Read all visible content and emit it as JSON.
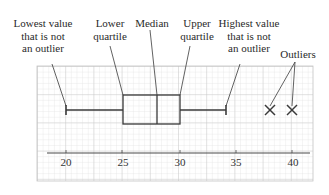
{
  "diagram": {
    "type": "box-plot",
    "labels": {
      "lowest": [
        "Lowest value",
        "that is not",
        "an outlier"
      ],
      "lower_quartile": [
        "Lower",
        "quartile"
      ],
      "median": [
        "Median"
      ],
      "upper_quartile": [
        "Upper",
        "quartile"
      ],
      "highest": [
        "Highest value",
        "that is not",
        "an outlier"
      ],
      "outliers": [
        "Outliers"
      ]
    },
    "axis": {
      "ticks": [
        "20",
        "25",
        "30",
        "35",
        "40"
      ],
      "min": 18,
      "max": 42
    },
    "values": {
      "lowest_non_outlier": 20,
      "lower_quartile": 25,
      "median": 28,
      "upper_quartile": 30,
      "highest_non_outlier": 34,
      "outliers": [
        38,
        40
      ]
    },
    "colors": {
      "grid_minor": "#d6d6d6",
      "grid_major": "#bdbdbd",
      "ink": "#3a3a3a"
    }
  }
}
